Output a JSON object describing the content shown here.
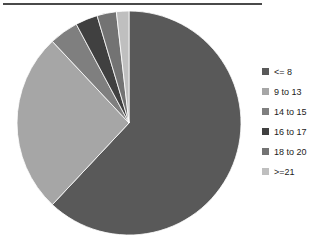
{
  "chart_data": {
    "type": "pie",
    "title": "",
    "subtitle": "",
    "xlabel": "",
    "ylabel": "",
    "grid": false,
    "legend_position": "right",
    "start_angle_deg": 0,
    "direction": "clockwise",
    "categories": [
      "<= 8",
      "9 to 13",
      "14 to 15",
      "16 to 17",
      "18 to 20",
      ">=21"
    ],
    "values": [
      62.0,
      26.0,
      4.2,
      3.2,
      2.8,
      1.8
    ],
    "units": "percent",
    "colors": [
      "#595959",
      "#a6a6a6",
      "#7f7f7f",
      "#404040",
      "#737373",
      "#bfbfbf"
    ],
    "slices": [
      {
        "label": "<= 8",
        "value": 62.0,
        "color": "#595959"
      },
      {
        "label": "9 to 13",
        "value": 26.0,
        "color": "#a6a6a6"
      },
      {
        "label": "14 to 15",
        "value": 4.2,
        "color": "#7f7f7f"
      },
      {
        "label": "16 to 17",
        "value": 3.2,
        "color": "#404040"
      },
      {
        "label": "18 to 20",
        "value": 2.8,
        "color": "#737373"
      },
      {
        "label": ">=21",
        "value": 1.8,
        "color": "#bfbfbf"
      }
    ]
  },
  "legend": {
    "items": [
      {
        "label": "<= 8",
        "color": "#595959"
      },
      {
        "label": "9 to 13",
        "color": "#a6a6a6"
      },
      {
        "label": "14 to 15",
        "color": "#7f7f7f"
      },
      {
        "label": "16 to 17",
        "color": "#404040"
      },
      {
        "label": "18 to 20",
        "color": "#737373"
      },
      {
        "label": ">=21",
        "color": "#bfbfbf"
      }
    ]
  },
  "style": {
    "rule_color": "#4a4a4a",
    "background": "#ffffff",
    "text_color": "#1c1c1c"
  }
}
